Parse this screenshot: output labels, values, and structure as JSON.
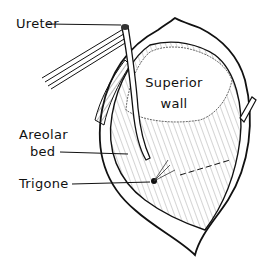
{
  "figure": {
    "colors": {
      "ink": "#111111",
      "background": "#ffffff"
    },
    "labels": [
      {
        "id": "ureter",
        "text": "Ureter"
      },
      {
        "id": "superior_wall_line1",
        "text": "Superior"
      },
      {
        "id": "superior_wall_line2",
        "text": "wall"
      },
      {
        "id": "areolar_line1",
        "text": "Areolar"
      },
      {
        "id": "areolar_line2",
        "text": "bed"
      },
      {
        "id": "trigone",
        "text": "Trigone"
      }
    ]
  }
}
